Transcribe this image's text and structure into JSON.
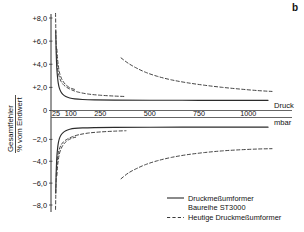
{
  "panel": {
    "label": "b"
  },
  "chart_data": {
    "type": "line",
    "title": "",
    "xlabel": "Druck",
    "xlabel_unit": "mbar",
    "ylabel_line1": "Gesamtfehler",
    "ylabel_line2": "% vom Endwert",
    "xticks": [
      25,
      100,
      250,
      500,
      750,
      1000
    ],
    "xtick_labels": [
      "25",
      "100",
      "250",
      "500",
      "750",
      "1000"
    ],
    "yticks": [
      8,
      6,
      4,
      2,
      0,
      -2,
      -4,
      -6,
      -8
    ],
    "ytick_labels": [
      "+8,0",
      "+6,0",
      "+4,0",
      "+2,0",
      "0",
      "−2,0",
      "−4,0",
      "−6,0",
      "−8,0"
    ],
    "xlim": [
      0,
      1120
    ],
    "ylim": [
      -8.6,
      8.6
    ],
    "grid": false,
    "legend_position": "bottom-right",
    "series": [
      {
        "name": "Druckmeßumformer Baureihe ST3000",
        "style": "solid",
        "color": "#2b2b2b",
        "points_upper": [
          [
            24,
            6.9
          ],
          [
            25,
            6.1
          ],
          [
            26,
            5.2
          ],
          [
            28,
            4.2
          ],
          [
            30,
            3.5
          ],
          [
            33,
            2.9
          ],
          [
            37,
            2.35
          ],
          [
            42,
            1.95
          ],
          [
            50,
            1.62
          ],
          [
            60,
            1.4
          ],
          [
            75,
            1.21
          ],
          [
            95,
            1.08
          ],
          [
            120,
            1.0
          ],
          [
            160,
            0.95
          ],
          [
            220,
            0.92
          ],
          [
            320,
            0.9
          ],
          [
            500,
            0.89
          ],
          [
            750,
            0.88
          ],
          [
            1000,
            0.88
          ],
          [
            1100,
            0.88
          ]
        ],
        "points_lower": [
          [
            24,
            -6.9
          ],
          [
            25,
            -6.1
          ],
          [
            26,
            -5.2
          ],
          [
            28,
            -4.2
          ],
          [
            30,
            -3.5
          ],
          [
            33,
            -2.9
          ],
          [
            37,
            -2.35
          ],
          [
            42,
            -1.95
          ],
          [
            50,
            -1.62
          ],
          [
            60,
            -1.4
          ],
          [
            75,
            -1.21
          ],
          [
            95,
            -1.08
          ],
          [
            120,
            -1.0
          ],
          [
            160,
            -0.95
          ],
          [
            220,
            -0.92
          ],
          [
            320,
            -0.9
          ],
          [
            500,
            -0.89
          ],
          [
            750,
            -0.88
          ],
          [
            1000,
            -0.88
          ],
          [
            1100,
            -0.88
          ]
        ]
      },
      {
        "name": "Heutige Druckmeßumformer",
        "style": "dashed",
        "color": "#3a3a3a",
        "points_upper": [
          [
            23,
            8.4
          ],
          [
            24,
            7.4
          ],
          [
            25,
            6.4
          ],
          [
            27,
            5.3
          ],
          [
            29,
            4.5
          ],
          [
            32,
            3.9
          ],
          [
            36,
            3.35
          ],
          [
            42,
            2.9
          ],
          [
            50,
            2.55
          ],
          [
            62,
            2.25
          ],
          [
            80,
            2.0
          ],
          [
            105,
            1.78
          ],
          [
            140,
            1.58
          ],
          [
            190,
            1.42
          ],
          [
            250,
            1.32
          ],
          [
            320,
            1.25
          ],
          [
            380,
            1.21
          ]
        ],
        "points_lower": [
          [
            23,
            -8.4
          ],
          [
            24,
            -7.4
          ],
          [
            25,
            -6.4
          ],
          [
            27,
            -5.3
          ],
          [
            29,
            -4.5
          ],
          [
            32,
            -3.9
          ],
          [
            36,
            -3.35
          ],
          [
            42,
            -2.9
          ],
          [
            50,
            -2.55
          ],
          [
            62,
            -2.25
          ],
          [
            80,
            -2.0
          ],
          [
            105,
            -1.78
          ],
          [
            140,
            -1.58
          ],
          [
            190,
            -1.42
          ],
          [
            250,
            -1.32
          ],
          [
            320,
            -1.25
          ],
          [
            380,
            -1.21
          ]
        ]
      },
      {
        "name": "Heutige Druckmeßumformer (inner band)",
        "style": "dashed",
        "color": "#3a3a3a",
        "points_upper": [
          [
            30,
            5.3
          ],
          [
            33,
            4.5
          ],
          [
            37,
            3.9
          ],
          [
            42,
            3.35
          ],
          [
            50,
            2.9
          ],
          [
            60,
            2.55
          ],
          [
            72,
            2.28
          ],
          [
            88,
            2.05
          ],
          [
            105,
            1.9
          ],
          [
            125,
            1.8
          ]
        ],
        "points_lower": [
          [
            30,
            -5.3
          ],
          [
            33,
            -4.5
          ],
          [
            37,
            -3.9
          ],
          [
            42,
            -3.35
          ],
          [
            50,
            -2.9
          ],
          [
            60,
            -2.55
          ],
          [
            72,
            -2.28
          ],
          [
            88,
            -2.05
          ],
          [
            105,
            -1.9
          ],
          [
            125,
            -1.8
          ]
        ]
      },
      {
        "name": "Heutige Druckmeßumformer (high range)",
        "style": "dashed",
        "color": "#3a3a3a",
        "points_upper": [
          [
            355,
            4.55
          ],
          [
            390,
            4.1
          ],
          [
            430,
            3.7
          ],
          [
            480,
            3.3
          ],
          [
            540,
            2.95
          ],
          [
            610,
            2.65
          ],
          [
            690,
            2.4
          ],
          [
            780,
            2.18
          ],
          [
            870,
            2.0
          ],
          [
            960,
            1.85
          ],
          [
            1050,
            1.72
          ],
          [
            1120,
            1.65
          ]
        ],
        "points_lower": [
          [
            355,
            -5.6
          ],
          [
            390,
            -5.1
          ],
          [
            430,
            -4.7
          ],
          [
            480,
            -4.3
          ],
          [
            540,
            -3.95
          ],
          [
            610,
            -3.65
          ],
          [
            690,
            -3.4
          ],
          [
            780,
            -3.2
          ],
          [
            870,
            -3.05
          ],
          [
            960,
            -2.95
          ],
          [
            1050,
            -2.88
          ],
          [
            1120,
            -2.85
          ]
        ]
      }
    ],
    "legend": [
      {
        "label_line1": "Druckmeßumformer",
        "label_line2": "Baureihe ST3000",
        "style": "solid"
      },
      {
        "label_line1": "Heutige Druckmeßumformer",
        "label_line2": "",
        "style": "dashed"
      }
    ]
  }
}
